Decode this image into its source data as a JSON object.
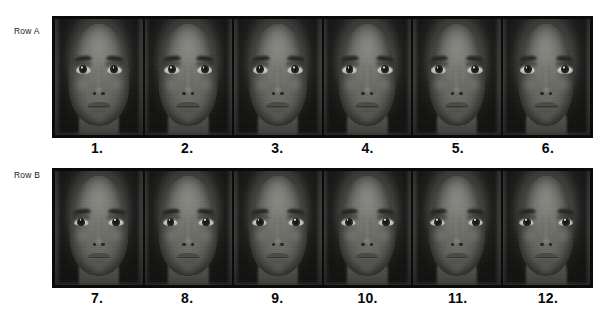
{
  "figure": {
    "background_color": "#ffffff",
    "frame_color": "#0a0a0a",
    "top_cut_text": "· · · ·"
  },
  "rows": [
    {
      "id": "row-a",
      "label": "Row A",
      "faces": [
        {
          "caption": "1.",
          "alt": "grayscale frontal female face photograph 1"
        },
        {
          "caption": "2.",
          "alt": "grayscale frontal female face photograph 2"
        },
        {
          "caption": "3.",
          "alt": "grayscale frontal female face photograph 3"
        },
        {
          "caption": "4.",
          "alt": "grayscale frontal female face photograph 4"
        },
        {
          "caption": "5.",
          "alt": "grayscale frontal female face photograph 5"
        },
        {
          "caption": "6.",
          "alt": "grayscale frontal female face photograph 6"
        }
      ]
    },
    {
      "id": "row-b",
      "label": "Row B",
      "faces": [
        {
          "caption": "7.",
          "alt": "grayscale frontal female face photograph 7"
        },
        {
          "caption": "8.",
          "alt": "grayscale frontal female face photograph 8"
        },
        {
          "caption": "9.",
          "alt": "grayscale frontal female face photograph 9"
        },
        {
          "caption": "10.",
          "alt": "grayscale frontal female face photograph 10"
        },
        {
          "caption": "11.",
          "alt": "grayscale frontal female face photograph 11"
        },
        {
          "caption": "12.",
          "alt": "grayscale frontal female face photograph 12"
        }
      ]
    }
  ]
}
